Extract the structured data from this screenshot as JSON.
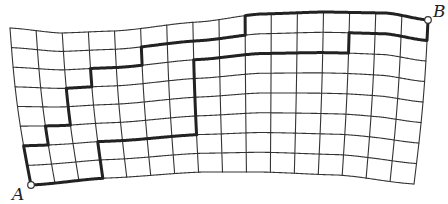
{
  "diagram": {
    "type": "lattice-path-on-curved-grid",
    "grid": {
      "columns": 16,
      "rows": 8,
      "line_color": "#333333",
      "line_width": 1.1,
      "corners": {
        "top_left": [
          10,
          28
        ],
        "top_right": [
          428,
          20
        ],
        "bottom_left": [
          31,
          185
        ],
        "bottom_right": [
          414,
          184
        ]
      },
      "top_edge_profile": [
        [
          0,
          28
        ],
        [
          0.12,
          33
        ],
        [
          0.25,
          31
        ],
        [
          0.45,
          22
        ],
        [
          0.6,
          14
        ],
        [
          0.75,
          12
        ],
        [
          0.9,
          13
        ],
        [
          1,
          20
        ]
      ],
      "bottom_edge_profile": [
        [
          0,
          185
        ],
        [
          0.2,
          178
        ],
        [
          0.45,
          172
        ],
        [
          0.6,
          172
        ],
        [
          0.8,
          175
        ],
        [
          1,
          184
        ]
      ]
    },
    "paths": [
      {
        "name": "upper-staircase-path",
        "color": "#222222",
        "width": 3,
        "vertices": [
          [
            0,
            8
          ],
          [
            0,
            6
          ],
          [
            1,
            6
          ],
          [
            1,
            5
          ],
          [
            2,
            5
          ],
          [
            2,
            3
          ],
          [
            3,
            3
          ],
          [
            3,
            2
          ],
          [
            5,
            2
          ],
          [
            5,
            1
          ],
          [
            9,
            1
          ],
          [
            9,
            0
          ],
          [
            16,
            0
          ]
        ]
      },
      {
        "name": "lower-staircase-path",
        "color": "#222222",
        "width": 3,
        "vertices": [
          [
            0,
            8
          ],
          [
            3,
            8
          ],
          [
            3,
            6
          ],
          [
            7,
            6
          ],
          [
            7,
            2
          ],
          [
            13,
            2
          ],
          [
            13,
            1
          ],
          [
            16,
            1
          ],
          [
            16,
            0
          ]
        ]
      }
    ],
    "points": {
      "start": {
        "label": "A",
        "grid": [
          0,
          8
        ],
        "label_pos": [
          12,
          186
        ]
      },
      "end": {
        "label": "B",
        "grid": [
          16,
          0
        ],
        "label_pos": [
          433,
          3
        ]
      }
    }
  }
}
